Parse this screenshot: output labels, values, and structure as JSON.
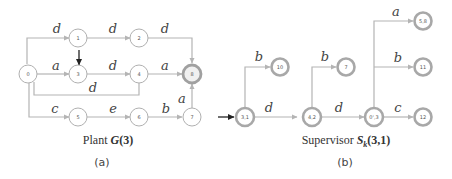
{
  "panel_a": {
    "caption_prefix": "Plant ",
    "caption_symbol": "G",
    "caption_args": "(3)",
    "panel_label": "(a)",
    "nodes": [
      {
        "id": "0",
        "label": "0",
        "type": "normal"
      },
      {
        "id": "1",
        "label": "1",
        "type": "normal"
      },
      {
        "id": "2",
        "label": "2",
        "type": "normal"
      },
      {
        "id": "3",
        "label": "3",
        "type": "initial"
      },
      {
        "id": "4",
        "label": "4",
        "type": "normal"
      },
      {
        "id": "5",
        "label": "5",
        "type": "normal"
      },
      {
        "id": "6",
        "label": "6",
        "type": "normal"
      },
      {
        "id": "7",
        "label": "7",
        "type": "normal"
      },
      {
        "id": "8",
        "label": "8",
        "type": "marked"
      }
    ],
    "edges": [
      {
        "from": "0",
        "to": "1",
        "label": "d"
      },
      {
        "from": "1",
        "to": "2",
        "label": "d"
      },
      {
        "from": "2",
        "to": "8",
        "label": "d"
      },
      {
        "from": "0",
        "to": "3",
        "label": "a"
      },
      {
        "from": "3",
        "to": "4",
        "label": "d"
      },
      {
        "from": "4",
        "to": "8",
        "label": "a"
      },
      {
        "from": "0",
        "to": "4",
        "label": "d"
      },
      {
        "from": "0",
        "to": "5",
        "label": "c"
      },
      {
        "from": "5",
        "to": "6",
        "label": "e"
      },
      {
        "from": "6",
        "to": "7",
        "label": "b"
      },
      {
        "from": "7",
        "to": "8",
        "label": "a"
      }
    ]
  },
  "panel_b": {
    "caption_prefix": "Supervisor ",
    "caption_symbol": "S",
    "caption_subscript": "k",
    "caption_args": "(3,1)",
    "panel_label": "(b)",
    "nodes": [
      {
        "id": "3,1",
        "label": "3,1",
        "type": "initial"
      },
      {
        "id": "10",
        "label": "10",
        "type": "normal"
      },
      {
        "id": "4,2",
        "label": "4,2",
        "type": "normal"
      },
      {
        "id": "7",
        "label": "7",
        "type": "normal"
      },
      {
        "id": "0',3",
        "label": "0',3",
        "type": "normal"
      },
      {
        "id": "5,8",
        "label": "5,8",
        "type": "normal"
      },
      {
        "id": "11",
        "label": "11",
        "type": "normal"
      },
      {
        "id": "12",
        "label": "12",
        "type": "normal"
      }
    ],
    "edges": [
      {
        "from": "3,1",
        "to": "10",
        "label": "b"
      },
      {
        "from": "3,1",
        "to": "4,2",
        "label": "d"
      },
      {
        "from": "4,2",
        "to": "7",
        "label": "b"
      },
      {
        "from": "4,2",
        "to": "0',3",
        "label": "d"
      },
      {
        "from": "0',3",
        "to": "5,8",
        "label": "a"
      },
      {
        "from": "0',3",
        "to": "11",
        "label": "b"
      },
      {
        "from": "0',3",
        "to": "12",
        "label": "c"
      }
    ]
  }
}
